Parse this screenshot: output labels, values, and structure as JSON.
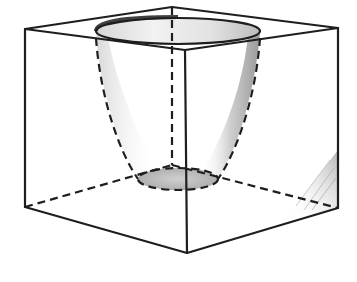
{
  "figure": {
    "title": "Cube with a bowl-shaped cavity cut into its top face",
    "colors": {
      "line": "#1e1e1e",
      "background": "#ffffff",
      "shade_light": "#eeeeee",
      "shade_mid": "#bdbdbd",
      "shade_dark": "#8a8a8a"
    },
    "cube": {
      "vertices": {
        "top_left": [
          25,
          29
        ],
        "top_back": [
          172,
          7
        ],
        "top_right": [
          338,
          28
        ],
        "top_front": [
          185,
          50
        ],
        "bottom_left": [
          25,
          207
        ],
        "bottom_back": [
          172,
          165
        ],
        "bottom_right": [
          338,
          208
        ],
        "bottom_front": [
          187,
          253
        ]
      },
      "visible_edges": 9,
      "hidden_edges": 3
    },
    "bowl": {
      "rim": {
        "cx": 178,
        "cy": 31,
        "rx": 82,
        "ry": 13
      },
      "base": {
        "cx": 178,
        "cy": 179,
        "rx": 40,
        "ry": 11
      }
    }
  }
}
